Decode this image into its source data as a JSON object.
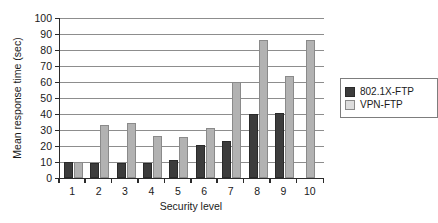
{
  "chart_data": {
    "type": "bar",
    "title": "",
    "xlabel": "Security level",
    "ylabel": "Mean response time (sec)",
    "categories": [
      "1",
      "2",
      "3",
      "4",
      "5",
      "6",
      "7",
      "8",
      "9",
      "10"
    ],
    "ylim": [
      0,
      100
    ],
    "yticks": [
      0,
      10,
      20,
      30,
      40,
      50,
      60,
      70,
      80,
      90,
      100
    ],
    "grid": "horizontal",
    "legend_position": "right",
    "series": [
      {
        "name": "802.1X-FTP",
        "color": "#3c3c3c",
        "values": [
          9.8,
          9.2,
          9.2,
          9.2,
          11.0,
          20.5,
          23.0,
          40.0,
          40.5,
          null
        ]
      },
      {
        "name": "VPN-FTP",
        "color": "#b2b2b2",
        "values": [
          9.8,
          33.0,
          34.5,
          26.0,
          25.5,
          31.5,
          60.0,
          86.0,
          64.0,
          86.5
        ]
      }
    ]
  }
}
